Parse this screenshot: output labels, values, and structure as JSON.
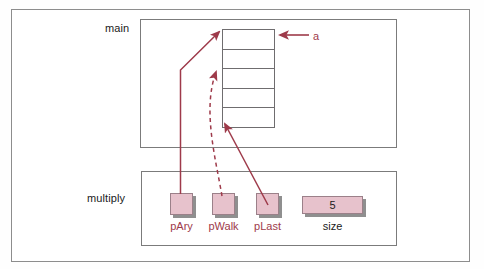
{
  "diagram": {
    "colors": {
      "accent": "#9e3a4a",
      "box_fill": "#e7c2cc",
      "box_border": "#9b8089",
      "frame_border": "#8d8d8d",
      "cell_border": "#6f6d6f",
      "shadow": "#8f8f8f",
      "text": "#1a1a1a"
    },
    "scopes": [
      {
        "id": "main",
        "label": "main"
      },
      {
        "id": "multiply",
        "label": "multiply"
      }
    ],
    "array": {
      "name": "a",
      "label": "a",
      "cell_count": 5,
      "cells": [
        "",
        "",
        "",
        "",
        ""
      ]
    },
    "variables": [
      {
        "id": "pAry",
        "label": "pAry",
        "value": "",
        "kind": "pointer",
        "points_to_cell": 1
      },
      {
        "id": "pWalk",
        "label": "pWalk",
        "value": "",
        "kind": "pointer",
        "points_to_cell": 3
      },
      {
        "id": "pLast",
        "label": "pLast",
        "value": "",
        "kind": "pointer",
        "points_to_cell": 5
      },
      {
        "id": "size",
        "label": "size",
        "value": "5",
        "kind": "value",
        "points_to_cell": 0
      }
    ],
    "arrows": [
      {
        "id": "a-arrow",
        "from": "a-label",
        "to": "array-cell-1",
        "style": "solid"
      },
      {
        "id": "pary-arrow",
        "from": "pAry",
        "to": "array-cell-1",
        "style": "solid"
      },
      {
        "id": "pwalk-arrow",
        "from": "pWalk",
        "to": "array-cell-3",
        "style": "dashed"
      },
      {
        "id": "plast-arrow",
        "from": "pLast",
        "to": "array-cell-5",
        "style": "solid"
      }
    ]
  }
}
